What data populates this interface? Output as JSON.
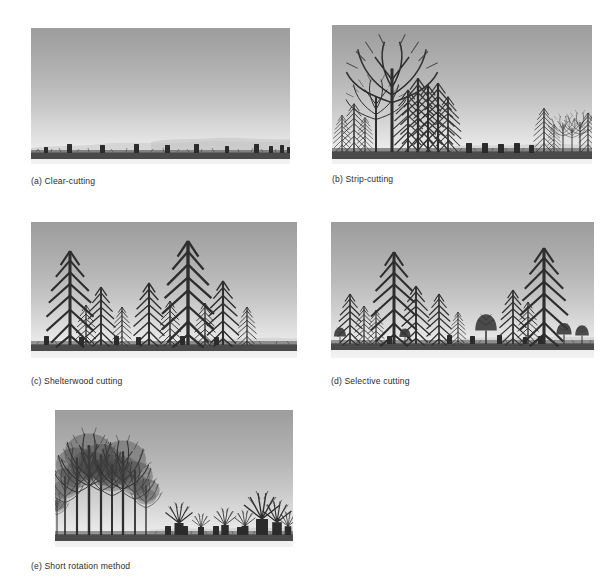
{
  "figure": {
    "background_color": "#ffffff",
    "panel_count": 5,
    "style": "grayscale line-and-wash landscape illustrations",
    "sky_gradient": [
      "#9d9d9d",
      "#f2f2f2"
    ],
    "ground_color": "#3a3a3a",
    "tree_color": "#2e2e2e"
  },
  "panels": [
    {
      "key": "a",
      "label": "(a) Clear-cutting",
      "caption_letter": "(a)",
      "caption_text": "Clear-cutting",
      "description": "Flat open ground with only cut stumps remaining; no standing trees.",
      "standing_trees": 0,
      "stumps": 11,
      "stump_positions": [
        14,
        27,
        40,
        52,
        63,
        75,
        86,
        92,
        96,
        98,
        99
      ],
      "distant_hills": true
    },
    {
      "key": "b",
      "label": "(b) Strip-cutting",
      "caption_letter": "(b)",
      "caption_text": "Strip-cutting",
      "description": "A dense strip of mature tall trees on the left, a cleared strip of stumps in the middle, and a younger strip of smaller trees on the right.",
      "standing_trees": 17,
      "stumps": 5,
      "stump_positions": [
        37,
        43,
        48,
        54,
        60
      ],
      "distant_hills": true
    },
    {
      "key": "c",
      "label": "(c) Shelterwood cutting",
      "caption_letter": "(c)",
      "caption_text": "Shelterwood cutting",
      "description": "Two very tall mature seed trees remain as shelter above a regenerating understory of medium and small conifers; scattered stumps along the ground.",
      "standing_trees": 12,
      "stumps": 6,
      "stump_positions": [
        5,
        20,
        33,
        42,
        58,
        70
      ],
      "distant_hills": true
    },
    {
      "key": "d",
      "label": "(d) Selective cutting",
      "caption_letter": "(d)",
      "caption_text": "Selective cutting",
      "description": "Mixed-age uneven stand with tall, medium and small trees remaining across the whole site; individual trees removed leaving scattered stumps.",
      "standing_trees": 14,
      "stumps": 6,
      "stump_positions": [
        24,
        42,
        52,
        62,
        75,
        82
      ],
      "distant_hills": true
    },
    {
      "key": "e",
      "label": "(e) Short rotation method",
      "caption_letter": "(e)",
      "caption_text": "Short rotation method",
      "description": "A cluster of fast-growing broadleaf trees on the left; the right side has been cut to low stumps with coppice sprouts regrowing.",
      "standing_trees": 9,
      "stumps": 6,
      "stump_positions": [
        46,
        53,
        60,
        66,
        76,
        86
      ],
      "coppice_regrowth": true,
      "distant_hills": true
    }
  ]
}
